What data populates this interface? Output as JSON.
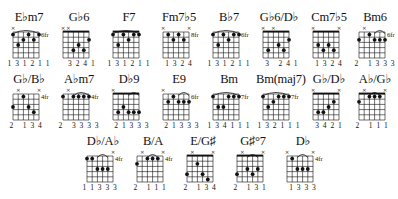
{
  "page": {
    "background": "#ffffff",
    "ink": "#111111"
  },
  "chords": [
    {
      "name": "E♭m7",
      "x": 6,
      "y": 10,
      "fret": "6fr",
      "nut": false,
      "muted": [
        1,
        0,
        0,
        0,
        0,
        0
      ],
      "barre": [
        0,
        5
      ],
      "dots": [
        [
          0,
          1
        ],
        [
          1,
          3
        ],
        [
          2,
          2
        ],
        [
          3,
          1
        ],
        [
          4,
          2
        ],
        [
          5,
          1
        ]
      ],
      "fingering": "1 3 1 2 1 1"
    },
    {
      "name": "G♭6",
      "x": 56,
      "y": 10,
      "fret": "",
      "nut": true,
      "muted": [
        1,
        1,
        0,
        0,
        0,
        0
      ],
      "barre": null,
      "dots": [
        [
          2,
          4
        ],
        [
          3,
          3
        ],
        [
          4,
          4
        ],
        [
          5,
          2
        ]
      ],
      "fingering": "  3 2 4 1"
    },
    {
      "name": "F7",
      "x": 106,
      "y": 10,
      "fret": "",
      "nut": true,
      "muted": [
        0,
        0,
        0,
        0,
        0,
        0
      ],
      "barre": [
        0,
        5
      ],
      "dots": [
        [
          0,
          1
        ],
        [
          1,
          3
        ],
        [
          2,
          1
        ],
        [
          3,
          2
        ],
        [
          4,
          1
        ],
        [
          5,
          1
        ]
      ],
      "fingering": "1 3 1 2 1 1"
    },
    {
      "name": "Fm7♭5",
      "x": 156,
      "y": 10,
      "fret": "8fr",
      "nut": false,
      "muted": [
        1,
        0,
        0,
        0,
        0,
        1
      ],
      "barre": null,
      "dots": [
        [
          1,
          1
        ],
        [
          2,
          2
        ],
        [
          3,
          1
        ],
        [
          4,
          2
        ]
      ],
      "fingering": "  1 3 2 4  "
    },
    {
      "name": "B♭7",
      "x": 206,
      "y": 10,
      "fret": "6fr",
      "nut": false,
      "muted": [
        0,
        0,
        0,
        0,
        0,
        0
      ],
      "barre": [
        0,
        5
      ],
      "dots": [
        [
          0,
          1
        ],
        [
          1,
          3
        ],
        [
          2,
          1
        ],
        [
          3,
          2
        ],
        [
          4,
          1
        ],
        [
          5,
          1
        ]
      ],
      "fingering": "1 3 1 2 1 1"
    },
    {
      "name": "G♭6/D♭",
      "x": 256,
      "y": 10,
      "fret": "",
      "nut": true,
      "muted": [
        1,
        0,
        1,
        0,
        0,
        0
      ],
      "barre": null,
      "dots": [
        [
          1,
          4
        ],
        [
          3,
          3
        ],
        [
          4,
          4
        ],
        [
          5,
          2
        ]
      ],
      "fingering": "  3   2 4 1"
    },
    {
      "name": "Cm7♭5",
      "x": 306,
      "y": 10,
      "fret": "",
      "nut": true,
      "muted": [
        1,
        0,
        0,
        0,
        0,
        1
      ],
      "barre": null,
      "dots": [
        [
          1,
          3
        ],
        [
          2,
          4
        ],
        [
          3,
          3
        ],
        [
          4,
          4
        ]
      ],
      "fingering": "  1 3 2 4  "
    },
    {
      "name": "Bm6",
      "x": 352,
      "y": 10,
      "fret": "6fr",
      "nut": false,
      "muted": [
        0,
        1,
        0,
        0,
        0,
        0
      ],
      "barre": [
        3,
        5
      ],
      "dots": [
        [
          0,
          2
        ],
        [
          2,
          1
        ],
        [
          3,
          2
        ],
        [
          4,
          2
        ],
        [
          5,
          2
        ]
      ],
      "fingering": "2   1 3 3 3"
    },
    {
      "name": "G♭/B♭",
      "x": 6,
      "y": 72,
      "fret": "4fr",
      "nut": false,
      "muted": [
        0,
        1,
        0,
        0,
        0,
        1
      ],
      "barre": null,
      "dots": [
        [
          0,
          3
        ],
        [
          2,
          1
        ],
        [
          3,
          3
        ],
        [
          4,
          4
        ]
      ],
      "fingering": "2   1 3 4  "
    },
    {
      "name": "A♭m7",
      "x": 56,
      "y": 72,
      "fret": "4fr",
      "nut": false,
      "muted": [
        0,
        1,
        0,
        0,
        0,
        0
      ],
      "barre": [
        2,
        5
      ],
      "dots": [
        [
          0,
          1
        ],
        [
          2,
          1
        ],
        [
          3,
          1
        ],
        [
          4,
          1
        ],
        [
          5,
          1
        ]
      ],
      "fingering": "2   3 3 3 3"
    },
    {
      "name": "D♭9",
      "x": 106,
      "y": 72,
      "fret": "",
      "nut": true,
      "muted": [
        1,
        0,
        0,
        0,
        0,
        0
      ],
      "barre": [
        3,
        5
      ],
      "dots": [
        [
          1,
          4
        ],
        [
          2,
          3
        ],
        [
          3,
          4
        ],
        [
          4,
          4
        ],
        [
          5,
          4
        ]
      ],
      "fingering": "  2 1 3 3 3"
    },
    {
      "name": "E9",
      "x": 156,
      "y": 72,
      "fret": "6fr",
      "nut": false,
      "muted": [
        1,
        0,
        0,
        0,
        0,
        0
      ],
      "barre": [
        3,
        5
      ],
      "dots": [
        [
          1,
          2
        ],
        [
          2,
          1
        ],
        [
          3,
          2
        ],
        [
          4,
          2
        ],
        [
          5,
          2
        ]
      ],
      "fingering": "  2 1 3 3 3"
    },
    {
      "name": "Bm",
      "x": 206,
      "y": 72,
      "fret": "7fr",
      "nut": false,
      "muted": [
        0,
        0,
        0,
        0,
        0,
        0
      ],
      "barre": [
        0,
        5
      ],
      "dots": [
        [
          0,
          1
        ],
        [
          1,
          3
        ],
        [
          2,
          3
        ],
        [
          3,
          1
        ],
        [
          4,
          1
        ],
        [
          5,
          1
        ]
      ],
      "fingering": "1 3 4 1 1 1"
    },
    {
      "name": "Bm(maj7)",
      "x": 256,
      "y": 72,
      "fret": "7fr",
      "nut": false,
      "muted": [
        0,
        0,
        0,
        0,
        0,
        0
      ],
      "barre": [
        0,
        5
      ],
      "dots": [
        [
          0,
          1
        ],
        [
          1,
          3
        ],
        [
          2,
          2
        ],
        [
          3,
          1
        ],
        [
          4,
          1
        ],
        [
          5,
          1
        ]
      ],
      "fingering": "1 3 2 1 1 1"
    },
    {
      "name": "G♭/D♭",
      "x": 306,
      "y": 72,
      "fret": "",
      "nut": true,
      "muted": [
        1,
        0,
        0,
        0,
        0,
        1
      ],
      "barre": null,
      "dots": [
        [
          1,
          4
        ],
        [
          2,
          4
        ],
        [
          3,
          3
        ],
        [
          4,
          2
        ]
      ],
      "fingering": "  3 4 2 1  "
    },
    {
      "name": "A♭/G♭",
      "x": 352,
      "y": 72,
      "fret": "",
      "nut": true,
      "muted": [
        0,
        1,
        0,
        0,
        0,
        1
      ],
      "barre": [
        2,
        4
      ],
      "dots": [
        [
          0,
          2
        ],
        [
          2,
          1
        ],
        [
          3,
          1
        ],
        [
          4,
          1
        ]
      ],
      "fingering": "2   1 1 1  "
    },
    {
      "name": "D♭/A♭",
      "x": 80,
      "y": 134,
      "fret": "4fr",
      "nut": false,
      "muted": [
        0,
        0,
        0,
        0,
        0,
        1
      ],
      "barre": [
        2,
        4
      ],
      "dots": [
        [
          0,
          1
        ],
        [
          1,
          1
        ],
        [
          2,
          3
        ],
        [
          3,
          3
        ],
        [
          4,
          3
        ]
      ],
      "fingering": "1 1 3 3 3  "
    },
    {
      "name": "B/A",
      "x": 130,
      "y": 134,
      "fret": "4fr",
      "nut": false,
      "muted": [
        0,
        1,
        0,
        0,
        0,
        1
      ],
      "barre": [
        2,
        4
      ],
      "dots": [
        [
          0,
          2
        ],
        [
          2,
          1
        ],
        [
          3,
          1
        ],
        [
          4,
          1
        ]
      ],
      "fingering": "2   1 1 1  "
    },
    {
      "name": "E/G♯",
      "x": 180,
      "y": 134,
      "fret": "",
      "nut": true,
      "muted": [
        0,
        1,
        0,
        0,
        0,
        1
      ],
      "barre": null,
      "dots": [
        [
          0,
          4
        ],
        [
          2,
          2
        ],
        [
          3,
          4
        ],
        [
          4,
          5
        ]
      ],
      "fingering": "2   1 3 4  "
    },
    {
      "name": "G♯°7",
      "x": 230,
      "y": 134,
      "fret": "",
      "nut": true,
      "muted": [
        0,
        1,
        0,
        0,
        0,
        1
      ],
      "barre": [
        2,
        4
      ],
      "dots": [
        [
          0,
          4
        ],
        [
          2,
          3
        ],
        [
          3,
          4
        ],
        [
          4,
          3
        ]
      ],
      "fingering": "2   1 3 1  "
    },
    {
      "name": "D♭",
      "x": 280,
      "y": 134,
      "fret": "4fr",
      "nut": false,
      "muted": [
        1,
        0,
        0,
        0,
        0,
        1
      ],
      "barre": [
        2,
        4
      ],
      "dots": [
        [
          1,
          1
        ],
        [
          2,
          3
        ],
        [
          3,
          3
        ],
        [
          4,
          3
        ]
      ],
      "fingering": "  1 3 3 3  "
    }
  ]
}
